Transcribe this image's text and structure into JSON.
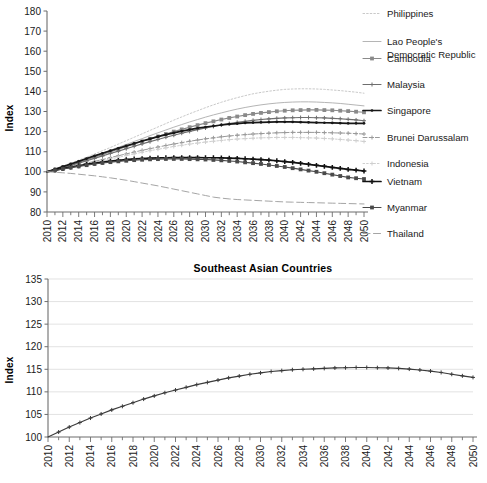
{
  "chart_data": [
    {
      "type": "line",
      "panel": "top",
      "title": "",
      "xlabel": "",
      "ylabel": "Index",
      "xlim": [
        2010,
        2050
      ],
      "ylim": [
        80,
        180
      ],
      "yticks": [
        80,
        90,
        100,
        110,
        120,
        130,
        140,
        150,
        160,
        170,
        180
      ],
      "xticks": [
        2010,
        2012,
        2014,
        2016,
        2018,
        2020,
        2022,
        2024,
        2026,
        2028,
        2030,
        2032,
        2034,
        2036,
        2038,
        2040,
        2042,
        2044,
        2046,
        2048,
        2050
      ],
      "x": [
        2010,
        2011,
        2012,
        2013,
        2014,
        2015,
        2016,
        2017,
        2018,
        2019,
        2020,
        2021,
        2022,
        2023,
        2024,
        2025,
        2026,
        2027,
        2028,
        2029,
        2030,
        2031,
        2032,
        2033,
        2034,
        2035,
        2036,
        2037,
        2038,
        2039,
        2040,
        2041,
        2042,
        2043,
        2044,
        2045,
        2046,
        2047,
        2048,
        2049,
        2050
      ],
      "grid": false,
      "legend_position": "right",
      "series": [
        {
          "name": "Philippines",
          "marker": "none",
          "style": "dotted",
          "color": "#c9c9c9",
          "values": [
            100.0,
            101.4,
            102.8,
            104.3,
            105.8,
            107.3,
            108.9,
            110.5,
            112.1,
            113.8,
            115.5,
            117.2,
            118.9,
            120.6,
            122.3,
            124.0,
            125.7,
            127.3,
            128.9,
            130.4,
            131.9,
            133.3,
            134.6,
            135.8,
            136.9,
            137.9,
            138.8,
            139.5,
            140.1,
            140.6,
            141.0,
            141.2,
            141.3,
            141.3,
            141.2,
            141.0,
            140.7,
            140.4,
            140.0,
            139.6,
            139.1
          ]
        },
        {
          "name": "Lao People's Democratic Republic",
          "marker": "none",
          "style": "solid-light",
          "color": "#b5b5b5",
          "values": [
            100.0,
            101.2,
            102.5,
            103.8,
            105.1,
            106.5,
            107.9,
            109.3,
            110.7,
            112.2,
            113.6,
            115.1,
            116.5,
            118.0,
            119.4,
            120.8,
            122.2,
            123.5,
            124.8,
            126.0,
            127.2,
            128.3,
            129.3,
            130.3,
            131.2,
            132.0,
            132.7,
            133.3,
            133.8,
            134.2,
            134.5,
            134.7,
            134.8,
            134.8,
            134.7,
            134.5,
            134.3,
            134.0,
            133.6,
            133.2,
            132.8
          ]
        },
        {
          "name": "Cambodia",
          "marker": "square",
          "style": "solid",
          "color": "#8a8a8a",
          "values": [
            100.0,
            101.1,
            102.3,
            103.5,
            104.7,
            106.0,
            107.3,
            108.6,
            109.9,
            111.2,
            112.5,
            113.8,
            115.1,
            116.4,
            117.6,
            118.8,
            120.0,
            121.1,
            122.2,
            123.2,
            124.2,
            125.1,
            126.0,
            126.8,
            127.5,
            128.2,
            128.8,
            129.3,
            129.7,
            130.1,
            130.4,
            130.6,
            130.7,
            130.8,
            130.8,
            130.7,
            130.6,
            130.4,
            130.2,
            129.9,
            129.6
          ]
        },
        {
          "name": "Malaysia",
          "marker": "plus",
          "style": "solid",
          "color": "#6e6e6e",
          "values": [
            100.0,
            101.0,
            102.1,
            103.2,
            104.3,
            105.5,
            106.7,
            107.9,
            109.1,
            110.3,
            111.5,
            112.7,
            113.9,
            115.0,
            116.1,
            117.2,
            118.2,
            119.2,
            120.1,
            121.0,
            121.8,
            122.6,
            123.3,
            124.0,
            124.6,
            125.1,
            125.6,
            126.0,
            126.3,
            126.6,
            126.8,
            126.9,
            127.0,
            127.0,
            126.9,
            126.8,
            126.6,
            126.4,
            126.1,
            125.8,
            125.4
          ]
        },
        {
          "name": "Singapore",
          "marker": "dot",
          "style": "solid-bold",
          "color": "#171717",
          "values": [
            100.0,
            101.3,
            102.6,
            103.9,
            105.2,
            106.6,
            107.9,
            109.2,
            110.5,
            111.7,
            112.9,
            114.1,
            115.3,
            116.4,
            117.5,
            118.5,
            119.4,
            120.2,
            121.0,
            121.7,
            122.3,
            122.8,
            123.3,
            123.7,
            124.0,
            124.3,
            124.5,
            124.6,
            124.7,
            124.8,
            124.8,
            124.8,
            124.7,
            124.6,
            124.5,
            124.4,
            124.3,
            124.2,
            124.1,
            124.1,
            124.1
          ]
        },
        {
          "name": "Brunei Darussalam",
          "marker": "plus",
          "style": "dashed",
          "color": "#9a9a9a",
          "values": [
            100.0,
            100.8,
            101.6,
            102.5,
            103.4,
            104.3,
            105.2,
            106.1,
            107.1,
            108.0,
            108.9,
            109.8,
            110.7,
            111.5,
            112.3,
            113.1,
            113.8,
            114.5,
            115.2,
            115.8,
            116.4,
            116.9,
            117.4,
            117.8,
            118.2,
            118.5,
            118.8,
            119.0,
            119.2,
            119.4,
            119.5,
            119.6,
            119.6,
            119.6,
            119.6,
            119.5,
            119.4,
            119.3,
            119.2,
            119.0,
            118.8
          ]
        },
        {
          "name": "Indonesia",
          "marker": "plus",
          "style": "dotted",
          "color": "#cfcfcf",
          "values": [
            100.0,
            100.7,
            101.4,
            102.2,
            103.0,
            103.8,
            104.7,
            105.5,
            106.4,
            107.2,
            108.1,
            108.9,
            109.7,
            110.5,
            111.2,
            111.9,
            112.6,
            113.2,
            113.8,
            114.3,
            114.8,
            115.2,
            115.6,
            116.0,
            116.3,
            116.5,
            116.7,
            116.9,
            117.0,
            117.1,
            117.1,
            117.1,
            117.0,
            116.9,
            116.8,
            116.6,
            116.4,
            116.1,
            115.8,
            115.5,
            115.1
          ]
        },
        {
          "name": "Vietnam",
          "marker": "plus-bold",
          "style": "solid-bold",
          "color": "#111111",
          "values": [
            100.0,
            100.8,
            101.6,
            102.3,
            103.0,
            103.7,
            104.3,
            104.8,
            105.3,
            105.7,
            106.1,
            106.4,
            106.6,
            106.8,
            106.9,
            107.0,
            107.1,
            107.1,
            107.1,
            107.1,
            107.0,
            107.0,
            106.9,
            106.8,
            106.7,
            106.5,
            106.3,
            106.1,
            105.8,
            105.5,
            105.1,
            104.7,
            104.2,
            103.7,
            103.2,
            102.7,
            102.2,
            101.7,
            101.2,
            100.8,
            100.4
          ]
        },
        {
          "name": "Myanmar",
          "marker": "square",
          "style": "solid",
          "color": "#4a4a4a",
          "values": [
            100.0,
            100.7,
            101.4,
            102.1,
            102.7,
            103.3,
            103.9,
            104.4,
            104.8,
            105.2,
            105.5,
            105.8,
            106.0,
            106.2,
            106.3,
            106.4,
            106.4,
            106.4,
            106.3,
            106.2,
            106.1,
            105.9,
            105.7,
            105.4,
            105.1,
            104.7,
            104.3,
            103.9,
            103.4,
            102.9,
            102.4,
            101.8,
            101.2,
            100.6,
            100.0,
            99.3,
            98.6,
            97.9,
            97.2,
            96.8,
            96.4
          ]
        },
        {
          "name": "Thailand",
          "marker": "none",
          "style": "dashed-long",
          "color": "#a5a5a5",
          "values": [
            100.0,
            99.8,
            99.5,
            99.2,
            98.8,
            98.4,
            98.0,
            97.5,
            97.0,
            96.4,
            95.8,
            95.1,
            94.4,
            93.7,
            93.0,
            92.2,
            91.4,
            90.6,
            89.8,
            89.0,
            88.2,
            87.4,
            86.9,
            86.5,
            86.2,
            86.0,
            85.8,
            85.6,
            85.4,
            85.2,
            85.0,
            84.9,
            84.8,
            84.7,
            84.6,
            84.5,
            84.4,
            84.3,
            84.2,
            84.1,
            84.0
          ]
        }
      ]
    },
    {
      "type": "line",
      "panel": "bottom",
      "title": "Southeast Asian Countries",
      "xlabel": "",
      "ylabel": "Index",
      "xlim": [
        2010,
        2050
      ],
      "ylim": [
        100,
        135
      ],
      "yticks": [
        100,
        105,
        110,
        115,
        120,
        125,
        130,
        135
      ],
      "xticks": [
        2010,
        2012,
        2014,
        2016,
        2018,
        2020,
        2022,
        2024,
        2026,
        2028,
        2030,
        2032,
        2034,
        2036,
        2038,
        2040,
        2042,
        2044,
        2046,
        2048,
        2050
      ],
      "grid": true,
      "legend_position": "none",
      "series": [
        {
          "name": "Southeast Asian Countries",
          "marker": "plus",
          "style": "solid",
          "color": "#3b3b3b",
          "x": [
            2010,
            2011,
            2012,
            2013,
            2014,
            2015,
            2016,
            2017,
            2018,
            2019,
            2020,
            2021,
            2022,
            2023,
            2024,
            2025,
            2026,
            2027,
            2028,
            2029,
            2030,
            2031,
            2032,
            2033,
            2034,
            2035,
            2036,
            2037,
            2038,
            2039,
            2040,
            2041,
            2042,
            2043,
            2044,
            2045,
            2046,
            2047,
            2048,
            2049,
            2050
          ],
          "values": [
            100.0,
            101.1,
            102.2,
            103.2,
            104.2,
            105.1,
            106.0,
            106.8,
            107.6,
            108.4,
            109.1,
            109.8,
            110.4,
            111.0,
            111.6,
            112.1,
            112.6,
            113.1,
            113.5,
            113.9,
            114.2,
            114.5,
            114.7,
            114.9,
            115.0,
            115.1,
            115.2,
            115.3,
            115.35,
            115.4,
            115.4,
            115.35,
            115.3,
            115.2,
            115.05,
            114.85,
            114.6,
            114.3,
            113.9,
            113.55,
            113.2
          ]
        }
      ]
    }
  ],
  "top_chart": {
    "ylabel": "Index",
    "legend": [
      {
        "label_line1": "Philippines",
        "label_line2": ""
      },
      {
        "label_line1": "Lao People's",
        "label_line2": "Democratic Republic"
      },
      {
        "label_line1": "Cambodia",
        "label_line2": ""
      },
      {
        "label_line1": "Malaysia",
        "label_line2": ""
      },
      {
        "label_line1": "Singapore",
        "label_line2": ""
      },
      {
        "label_line1": "Brunei Darussalam",
        "label_line2": ""
      },
      {
        "label_line1": "Indonesia",
        "label_line2": ""
      },
      {
        "label_line1": "Vietnam",
        "label_line2": ""
      },
      {
        "label_line1": "Myanmar",
        "label_line2": ""
      },
      {
        "label_line1": "Thailand",
        "label_line2": ""
      }
    ]
  },
  "bottom_chart": {
    "title": "Southeast Asian Countries",
    "ylabel": "Index"
  }
}
